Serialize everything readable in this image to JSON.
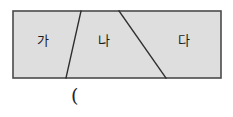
{
  "figure": {
    "type": "geometry-diagram",
    "colors": {
      "fill": "#dedede",
      "stroke": "#4a4a4a",
      "divider": "#2e2e2e",
      "text": "#1b1b1b",
      "background": "#ffffff"
    },
    "rectangle": {
      "x": 13,
      "y": 11,
      "width": 208,
      "height": 67,
      "stroke_width": 1.6
    },
    "dividers": [
      {
        "name": "divider-ga-na",
        "x1": 81,
        "y1": 11,
        "x2": 66,
        "y2": 78,
        "stroke_width": 1.4
      },
      {
        "name": "divider-na-da",
        "x1": 119,
        "y1": 11,
        "x2": 166,
        "y2": 78,
        "stroke_width": 1.4
      }
    ],
    "regions": [
      {
        "id": "ga",
        "label": "가"
      },
      {
        "id": "na",
        "label": "나"
      },
      {
        "id": "da",
        "label": "다"
      }
    ],
    "annotation": {
      "name": "answer-blank-parenthesis",
      "text": "("
    }
  }
}
